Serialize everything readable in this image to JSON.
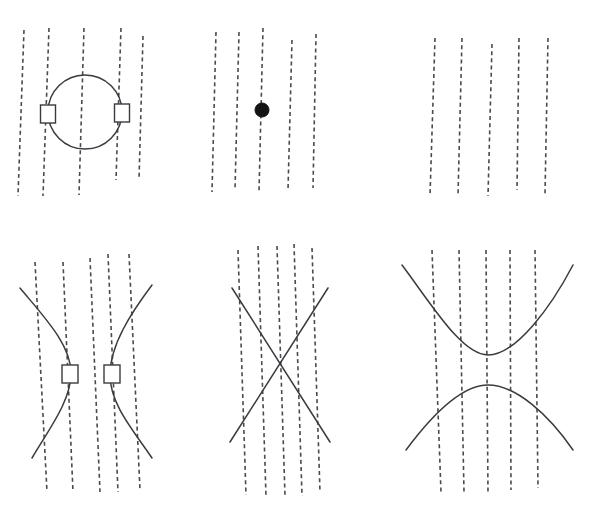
{
  "figure": {
    "background_color": "#ffffff",
    "curve_color": "#3a3a40",
    "dash_color": "#4a4a50",
    "marker_fill": "#ffffff",
    "dot_color": "#141414",
    "width": 615,
    "height": 532,
    "dash_pattern": "4 3.2",
    "grid_rows": 2,
    "grid_cols": 3
  },
  "chart_data": {
    "type": "scatter",
    "title": "",
    "subtitle": "",
    "xlabel": "",
    "ylabel": "",
    "grid": false,
    "legend": null,
    "panels": [
      {
        "id": "panel-top-left",
        "name": "circle-panel",
        "conic": "circle",
        "label": "",
        "dashed_lines": [
          {
            "x_top": 24,
            "y_top": 30,
            "x_bottom": 18,
            "y_bottom": 196
          },
          {
            "x_top": 49,
            "y_top": 28,
            "x_bottom": 43,
            "y_bottom": 196
          },
          {
            "x_top": 84,
            "y_top": 28,
            "x_bottom": 79,
            "y_bottom": 195
          },
          {
            "x_top": 121,
            "y_top": 28,
            "x_bottom": 116,
            "y_bottom": 180
          },
          {
            "x_top": 143,
            "y_top": 36,
            "x_bottom": 139,
            "y_bottom": 180
          }
        ],
        "circle": {
          "cx": 85,
          "cy": 112,
          "r": 37
        },
        "markers": [
          {
            "type": "rect",
            "cx": 48,
            "cy": 114,
            "w": 15,
            "h": 18
          },
          {
            "type": "rect",
            "cx": 122,
            "cy": 113,
            "w": 15,
            "h": 18
          }
        ]
      },
      {
        "id": "panel-top-middle",
        "name": "point-panel",
        "conic": "point",
        "label": "",
        "dashed_lines": [
          {
            "x_top": 216,
            "y_top": 32,
            "x_bottom": 212,
            "y_bottom": 192
          },
          {
            "x_top": 239,
            "y_top": 32,
            "x_bottom": 235,
            "y_bottom": 190
          },
          {
            "x_top": 263,
            "y_top": 28,
            "x_bottom": 259,
            "y_bottom": 192
          },
          {
            "x_top": 292,
            "y_top": 40,
            "x_bottom": 288,
            "y_bottom": 190
          },
          {
            "x_top": 316,
            "y_top": 34,
            "x_bottom": 313,
            "y_bottom": 188
          }
        ],
        "markers": [
          {
            "type": "dot",
            "cx": 262,
            "cy": 110,
            "r": 7
          }
        ]
      },
      {
        "id": "panel-top-right",
        "name": "empty-lines-panel",
        "conic": "none",
        "label": "",
        "dashed_lines": [
          {
            "x_top": 435,
            "y_top": 38,
            "x_bottom": 430,
            "y_bottom": 196
          },
          {
            "x_top": 462,
            "y_top": 38,
            "x_bottom": 458,
            "y_bottom": 196
          },
          {
            "x_top": 492,
            "y_top": 44,
            "x_bottom": 488,
            "y_bottom": 196
          },
          {
            "x_top": 519,
            "y_top": 38,
            "x_bottom": 517,
            "y_bottom": 190
          },
          {
            "x_top": 548,
            "y_top": 38,
            "x_bottom": 545,
            "y_bottom": 194
          }
        ],
        "markers": []
      },
      {
        "id": "panel-bottom-left",
        "name": "horizontal-hyperbola-panel",
        "conic": "hyperbola-horizontal",
        "label": "",
        "dashed_lines": [
          {
            "x_top": 35,
            "y_top": 262,
            "x_bottom": 47,
            "y_bottom": 492
          },
          {
            "x_top": 63,
            "y_top": 262,
            "x_bottom": 73,
            "y_bottom": 492
          },
          {
            "x_top": 90,
            "y_top": 258,
            "x_bottom": 100,
            "y_bottom": 492
          },
          {
            "x_top": 108,
            "y_top": 254,
            "x_bottom": 118,
            "y_bottom": 492
          },
          {
            "x_top": 129,
            "y_top": 254,
            "x_bottom": 140,
            "y_bottom": 490
          }
        ],
        "branches": [
          {
            "name": "left-branch",
            "vertex_x": 71,
            "vertex_y": 373,
            "opens": "left"
          },
          {
            "name": "right-branch",
            "vertex_x": 110,
            "vertex_y": 375,
            "opens": "right"
          }
        ],
        "markers": [
          {
            "type": "rect",
            "cx": 70,
            "cy": 374,
            "w": 16,
            "h": 18
          },
          {
            "type": "rect",
            "cx": 112,
            "cy": 374,
            "w": 16,
            "h": 18
          }
        ]
      },
      {
        "id": "panel-bottom-middle",
        "name": "crossing-lines-panel",
        "conic": "degenerate-crossing-lines",
        "label": "",
        "dashed_lines": [
          {
            "x_top": 238,
            "y_top": 250,
            "x_bottom": 246,
            "y_bottom": 495
          },
          {
            "x_top": 258,
            "y_top": 246,
            "x_bottom": 266,
            "y_bottom": 496
          },
          {
            "x_top": 277,
            "y_top": 246,
            "x_bottom": 285,
            "y_bottom": 496
          },
          {
            "x_top": 294,
            "y_top": 244,
            "x_bottom": 302,
            "y_bottom": 496
          },
          {
            "x_top": 312,
            "y_top": 248,
            "x_bottom": 320,
            "y_bottom": 492
          }
        ],
        "crossing_point": {
          "x": 276,
          "y": 360
        },
        "lines": [
          {
            "name": "down-right-line",
            "x1": 232,
            "y1": 288,
            "x2": 330,
            "y2": 442
          },
          {
            "name": "up-right-line",
            "x1": 230,
            "y1": 442,
            "x2": 328,
            "y2": 288
          }
        ],
        "markers": []
      },
      {
        "id": "panel-bottom-right",
        "name": "vertical-hyperbola-panel",
        "conic": "hyperbola-vertical",
        "label": "",
        "dashed_lines": [
          {
            "x_top": 432,
            "y_top": 250,
            "x_bottom": 441,
            "y_bottom": 492
          },
          {
            "x_top": 459,
            "y_top": 250,
            "x_bottom": 464,
            "y_bottom": 492
          },
          {
            "x_top": 486,
            "y_top": 250,
            "x_bottom": 488,
            "y_bottom": 494
          },
          {
            "x_top": 510,
            "y_top": 250,
            "x_bottom": 511,
            "y_bottom": 490
          },
          {
            "x_top": 535,
            "y_top": 250,
            "x_bottom": 538,
            "y_bottom": 488
          }
        ],
        "branches": [
          {
            "name": "upper-branch",
            "vertex_x": 488,
            "vertex_y": 355,
            "opens": "up"
          },
          {
            "name": "lower-branch",
            "vertex_x": 488,
            "vertex_y": 385,
            "opens": "down"
          }
        ],
        "markers": []
      }
    ]
  }
}
